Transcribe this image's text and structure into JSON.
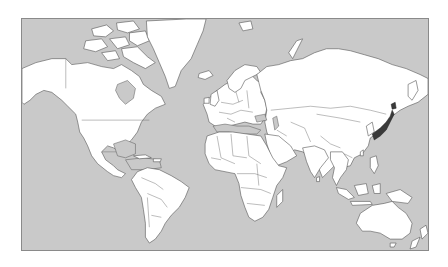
{
  "map": {
    "title": "World map (Mercator projection)",
    "projection": "Mercator",
    "ocean_color": "#c9c9c9",
    "land_color": "#ffffff",
    "border_color": "#555555",
    "highlighted_region": {
      "name": "Japan",
      "color": "#3a3a3a"
    },
    "shaded_regions": [
      "Hudson Bay",
      "Mediterranean Sea",
      "Black Sea",
      "Caspian Sea",
      "Gulf of Mexico",
      "Caribbean Sea"
    ],
    "continents": [
      "North America",
      "Greenland",
      "South America",
      "Europe",
      "Africa",
      "Asia",
      "Australia",
      "New Zealand"
    ]
  }
}
